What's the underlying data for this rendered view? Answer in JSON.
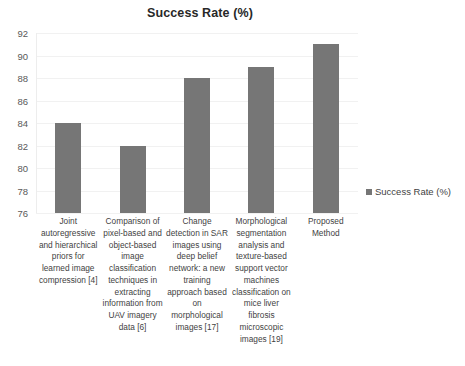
{
  "chart_data": {
    "type": "bar",
    "title": "Success Rate (%)",
    "xlabel": "",
    "ylabel": "",
    "ylim": [
      76,
      92
    ],
    "ytick_step": 2,
    "yticks": [
      92,
      90,
      88,
      86,
      84,
      82,
      80,
      78,
      76
    ],
    "grid": true,
    "legend_position": "right",
    "bar_color": "#767676",
    "gridline_color": "#f1f1f1",
    "background_color": "#ffffff",
    "categories": [
      "Joint autoregressive and hierarchical priors for learned image compression [4]",
      "Comparison of pixel-based and object-based image classification techniques in extracting information from UAV imagery data [6]",
      "Change detection in SAR images using deep belief network: a new training approach based on morphological images [17]",
      "Morphological segmentation analysis and texture-based support vector machines classification on mice liver fibrosis microscopic images [19]",
      "Proposed Method"
    ],
    "values": [
      84,
      82,
      88,
      89,
      91
    ],
    "series": [
      {
        "name": "Success Rate (%)",
        "values": [
          84,
          82,
          88,
          89,
          91
        ]
      }
    ],
    "legend": [
      {
        "label": "Success Rate (%)",
        "color": "#767676"
      }
    ]
  }
}
